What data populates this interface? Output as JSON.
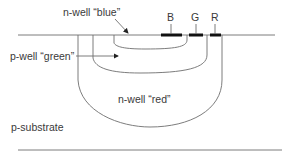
{
  "diagram": {
    "type": "cross-section",
    "labels": {
      "n_well_blue": "n-well “blue”",
      "p_well_green": "p-well “green”",
      "n_well_red": "n-well “red”",
      "p_substrate": "p-substrate"
    },
    "contacts": [
      {
        "id": "B",
        "label": "B"
      },
      {
        "id": "G",
        "label": "G"
      },
      {
        "id": "R",
        "label": "R"
      }
    ],
    "colors": {
      "line": "#6e6e6e",
      "contact": "#111111",
      "text": "#3a3a3a",
      "background": "#ffffff"
    }
  }
}
